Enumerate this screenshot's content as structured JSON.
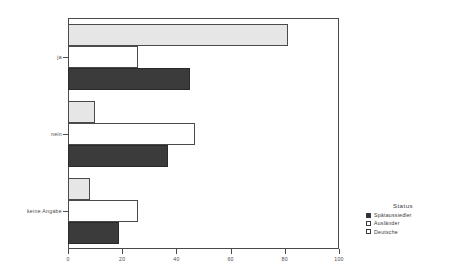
{
  "chart_data": {
    "type": "bar",
    "orientation": "horizontal",
    "title": "",
    "xlabel": "",
    "ylabel": "",
    "xlim": [
      0,
      100
    ],
    "xticks": [
      "0",
      "20",
      "40",
      "60",
      "80",
      "100"
    ],
    "grid": false,
    "categories": [
      "ja",
      "nein",
      "keine Angabe"
    ],
    "legend_title": "Status",
    "legend_position": "right",
    "series": [
      {
        "name": "Spätaussiedler",
        "color": "#3b3b3b",
        "values": [
          45,
          37,
          19
        ]
      },
      {
        "name": "Ausländer",
        "color": "#ffffff",
        "values": [
          26,
          47,
          26
        ]
      },
      {
        "name": "Deutsche",
        "color": "#e6e6e6",
        "values": [
          81,
          10,
          8
        ]
      }
    ]
  },
  "axis": {
    "x_ticks": [
      {
        "label": "0",
        "value": 0
      },
      {
        "label": "20",
        "value": 20
      },
      {
        "label": "40",
        "value": 40
      },
      {
        "label": "60",
        "value": 60
      },
      {
        "label": "80",
        "value": 80
      },
      {
        "label": "100",
        "value": 100
      }
    ],
    "y_categories": [
      {
        "label": "ja"
      },
      {
        "label": "nein"
      },
      {
        "label": "keine Angabe"
      }
    ]
  },
  "legend": {
    "title": "Status",
    "items": [
      {
        "label": "Spätaussiedler",
        "swatch": "swatch-filled-dark"
      },
      {
        "label": "Ausländer",
        "swatch": "swatch-outline-white"
      },
      {
        "label": "Deutsche",
        "swatch": "swatch-outline-light"
      }
    ]
  }
}
